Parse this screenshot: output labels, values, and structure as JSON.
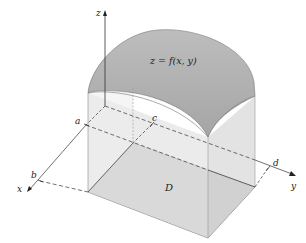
{
  "figure": {
    "surface_label": "z = f(x, y)",
    "region_label": "D",
    "axes": {
      "x": "x",
      "y": "y",
      "z": "z"
    },
    "bounds": {
      "a": "a",
      "b": "b",
      "c": "c",
      "d": "d"
    },
    "colors": {
      "surface_top": "#a9a9a9",
      "box_sides": "#e2e2e2",
      "region_floor": "#b8b8b8",
      "lines": "#333333"
    }
  }
}
